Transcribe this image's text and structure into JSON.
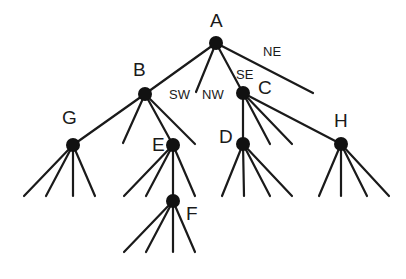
{
  "diagram": {
    "type": "quadtree",
    "colors": {
      "line": "#1a1a1a",
      "node": "#111111",
      "background": "#ffffff"
    },
    "nodes": [
      {
        "id": "A",
        "label": "A",
        "x": 216,
        "y": 43,
        "lx": 210,
        "ly": 27
      },
      {
        "id": "B",
        "label": "B",
        "x": 145,
        "y": 94,
        "lx": 133,
        "ly": 76
      },
      {
        "id": "C",
        "label": "C",
        "x": 243,
        "y": 93,
        "lx": 258,
        "ly": 94
      },
      {
        "id": "G",
        "label": "G",
        "x": 73,
        "y": 145,
        "lx": 62,
        "ly": 124
      },
      {
        "id": "E",
        "label": "E",
        "x": 173,
        "y": 145,
        "lx": 152,
        "ly": 151
      },
      {
        "id": "D",
        "label": "D",
        "x": 243,
        "y": 144,
        "lx": 219,
        "ly": 143
      },
      {
        "id": "H",
        "label": "H",
        "x": 341,
        "y": 144,
        "lx": 334,
        "ly": 127
      },
      {
        "id": "F",
        "label": "F",
        "x": 173,
        "y": 201,
        "lx": 186,
        "ly": 220
      }
    ],
    "edge_labels": [
      {
        "text": "SW",
        "x": 169,
        "y": 99
      },
      {
        "text": "NW",
        "x": 202,
        "y": 99
      },
      {
        "text": "SE",
        "x": 236,
        "y": 79
      },
      {
        "text": "NE",
        "x": 263,
        "y": 56
      }
    ],
    "edges": [
      {
        "from": [
          216,
          43
        ],
        "to": [
          145,
          94
        ]
      },
      {
        "from": [
          216,
          43
        ],
        "to": [
          196,
          92
        ]
      },
      {
        "from": [
          216,
          43
        ],
        "to": [
          243,
          93
        ]
      },
      {
        "from": [
          216,
          43
        ],
        "to": [
          313,
          93
        ]
      },
      {
        "from": [
          145,
          94
        ],
        "to": [
          73,
          145
        ]
      },
      {
        "from": [
          145,
          94
        ],
        "to": [
          123,
          143
        ]
      },
      {
        "from": [
          145,
          94
        ],
        "to": [
          173,
          145
        ]
      },
      {
        "from": [
          145,
          94
        ],
        "to": [
          195,
          144
        ]
      },
      {
        "from": [
          243,
          93
        ],
        "to": [
          243,
          144
        ]
      },
      {
        "from": [
          243,
          93
        ],
        "to": [
          270,
          144
        ]
      },
      {
        "from": [
          243,
          93
        ],
        "to": [
          292,
          144
        ]
      },
      {
        "from": [
          243,
          93
        ],
        "to": [
          341,
          144
        ]
      },
      {
        "from": [
          73,
          145
        ],
        "to": [
          24,
          196
        ]
      },
      {
        "from": [
          73,
          145
        ],
        "to": [
          46,
          196
        ]
      },
      {
        "from": [
          73,
          145
        ],
        "to": [
          73,
          196
        ]
      },
      {
        "from": [
          73,
          145
        ],
        "to": [
          95,
          196
        ]
      },
      {
        "from": [
          173,
          145
        ],
        "to": [
          124,
          196
        ]
      },
      {
        "from": [
          173,
          145
        ],
        "to": [
          146,
          196
        ]
      },
      {
        "from": [
          173,
          145
        ],
        "to": [
          173,
          201
        ]
      },
      {
        "from": [
          173,
          145
        ],
        "to": [
          195,
          196
        ]
      },
      {
        "from": [
          243,
          144
        ],
        "to": [
          222,
          196
        ]
      },
      {
        "from": [
          243,
          144
        ],
        "to": [
          244,
          196
        ]
      },
      {
        "from": [
          243,
          144
        ],
        "to": [
          270,
          196
        ]
      },
      {
        "from": [
          243,
          144
        ],
        "to": [
          292,
          196
        ]
      },
      {
        "from": [
          341,
          144
        ],
        "to": [
          319,
          196
        ]
      },
      {
        "from": [
          341,
          144
        ],
        "to": [
          341,
          196
        ]
      },
      {
        "from": [
          341,
          144
        ],
        "to": [
          367,
          196
        ]
      },
      {
        "from": [
          341,
          144
        ],
        "to": [
          389,
          196
        ]
      },
      {
        "from": [
          173,
          201
        ],
        "to": [
          124,
          252
        ]
      },
      {
        "from": [
          173,
          201
        ],
        "to": [
          146,
          252
        ]
      },
      {
        "from": [
          173,
          201
        ],
        "to": [
          173,
          252
        ]
      },
      {
        "from": [
          173,
          201
        ],
        "to": [
          195,
          252
        ]
      }
    ],
    "node_radius": 7
  }
}
